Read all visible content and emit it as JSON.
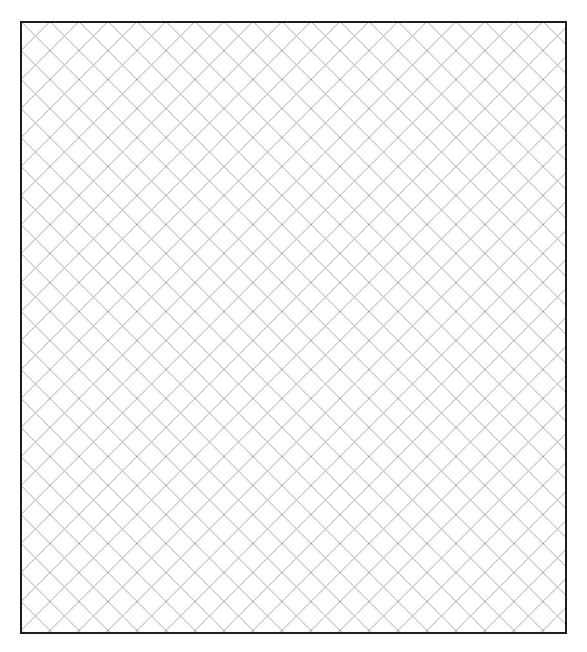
{
  "canvas": {
    "width": 587,
    "height": 652,
    "background": "#ffffff"
  },
  "panel": {
    "label": "Cross-hatch pattern panel",
    "x": 20,
    "y": 21,
    "width": 547,
    "height": 613,
    "border_color": "#1e1e1e",
    "border_width": 2,
    "fill": "#ffffff"
  },
  "pattern": {
    "type": "diagonal-cross-hatch",
    "angle_degrees": 45,
    "spacing_px": 29,
    "line_color": "#9e9e9e",
    "line_width": 0.9
  }
}
